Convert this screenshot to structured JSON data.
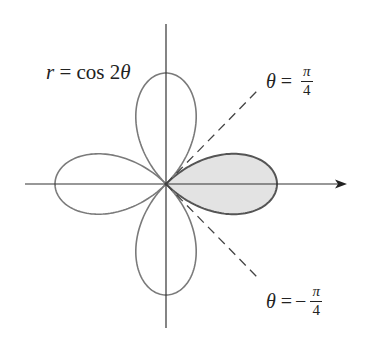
{
  "figure": {
    "equation_label": {
      "lhs": "r",
      "equals": "=",
      "rhs": "cos 2",
      "var": "θ"
    },
    "ray_upper_label": {
      "var": "θ",
      "equals": "=",
      "sign": "",
      "numerator": "π",
      "denominator": "4"
    },
    "ray_lower_label": {
      "var": "θ",
      "equals": "=",
      "sign": "−",
      "numerator": "π",
      "denominator": "4"
    },
    "colors": {
      "curve": "#7a7a7a",
      "shaded_outline": "#555555",
      "shaded_fill": "#e3e3e3",
      "axis": "#333333",
      "dashed_ray": "#444444",
      "text": "#222222"
    },
    "geometry": {
      "origin": [
        166,
        184
      ],
      "petal_radius_px": 111
    }
  }
}
